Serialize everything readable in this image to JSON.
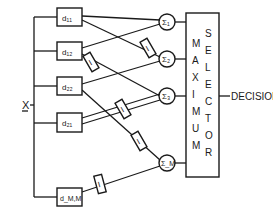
{
  "input_label": "X",
  "output_label": "DECISION",
  "selector": {
    "col1": [
      "M",
      "A",
      "X",
      "I",
      "M",
      "U",
      "M"
    ],
    "col2": [
      "S",
      "E",
      "L",
      "E",
      "C",
      "T",
      "O",
      "R"
    ]
  },
  "detectors": [
    "d₁₁",
    "d₁₂",
    "d₂₂",
    "d₂₁",
    "d_M,M"
  ],
  "summers": [
    "Σ₁",
    "Σ₂",
    "Σ₃",
    "Σ_M"
  ],
  "delay_label": "I",
  "colors": {
    "ink": "#1a1a1a",
    "background": "#ffffff"
  }
}
